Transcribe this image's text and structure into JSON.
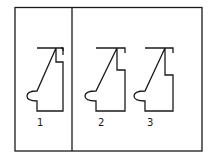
{
  "diagram": {
    "colors": {
      "line": "#1a1a1a",
      "background": "#ffffff"
    },
    "frame": {
      "left": 15,
      "top": 7,
      "right": 202,
      "bottom": 151,
      "divider_x": 72
    },
    "figures": [
      {
        "label": "1",
        "panel": "left"
      },
      {
        "label": "2",
        "panel": "right"
      },
      {
        "label": "3",
        "panel": "right"
      }
    ]
  }
}
